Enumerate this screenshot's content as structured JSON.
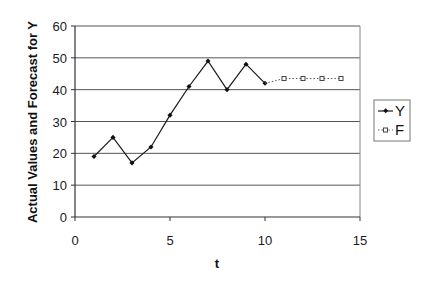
{
  "chart_data": {
    "type": "line",
    "title": "",
    "xlabel": "t",
    "ylabel": "Actual Values and Forecast for Y",
    "xlim": [
      0,
      15
    ],
    "ylim": [
      0,
      60
    ],
    "xticks": [
      0,
      5,
      10,
      15
    ],
    "yticks": [
      0,
      10,
      20,
      30,
      40,
      50,
      60
    ],
    "grid": {
      "horizontal": true,
      "vertical": false
    },
    "legend_position": "right",
    "series": [
      {
        "name": "Y",
        "style": "solid line, filled diamond markers",
        "color": "#1a1a1a",
        "x": [
          1,
          2,
          3,
          4,
          5,
          6,
          7,
          8,
          9,
          10
        ],
        "values": [
          19,
          25,
          17,
          22,
          32,
          41,
          49,
          40,
          48,
          42
        ]
      },
      {
        "name": "F",
        "style": "dotted line, hollow square markers",
        "color": "#555555",
        "x": [
          10,
          11,
          12,
          13,
          14
        ],
        "values": [
          42,
          43.5,
          43.5,
          43.5,
          43.5
        ],
        "marker_from_index": 1
      }
    ]
  },
  "legend": {
    "items": [
      {
        "label": "Y"
      },
      {
        "label": "F"
      }
    ]
  }
}
